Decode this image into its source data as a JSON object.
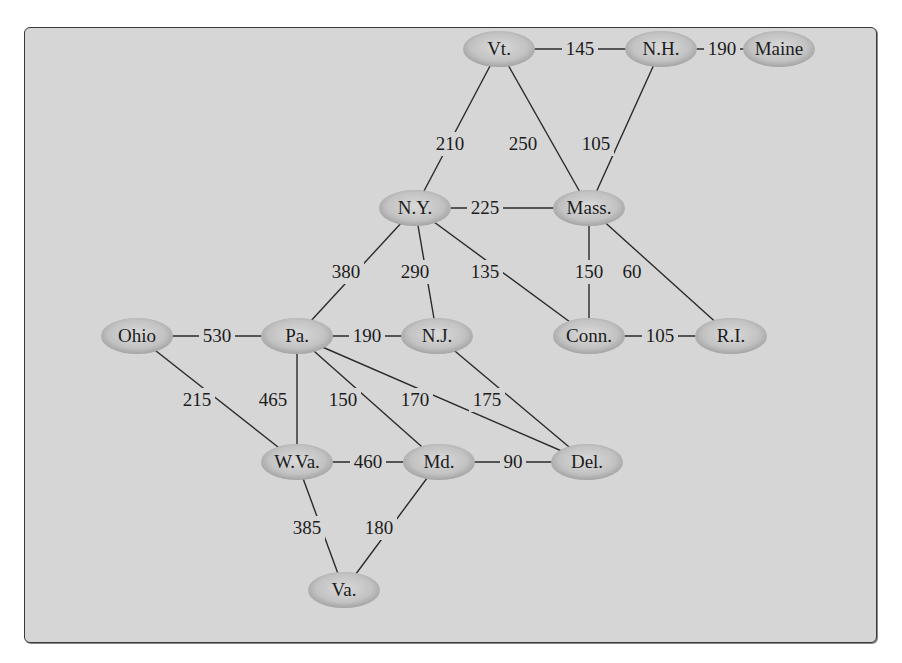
{
  "diagram": {
    "type": "weighted-undirected-graph",
    "colors": {
      "panel_bg": "#d6d6d6",
      "node_fill_center": "#d9d9d9",
      "node_fill_edge": "#9a9a9a",
      "edge": "#2a2a2a",
      "text": "#1c1c1c"
    },
    "nodes": [
      {
        "id": "vt",
        "label": "Vt.",
        "x": 474,
        "y": 21,
        "rx": 36,
        "ry": 18
      },
      {
        "id": "nh",
        "label": "N.H.",
        "x": 636,
        "y": 21,
        "rx": 36,
        "ry": 18
      },
      {
        "id": "me",
        "label": "Maine",
        "x": 754,
        "y": 21,
        "rx": 36,
        "ry": 18
      },
      {
        "id": "ny",
        "label": "N.Y.",
        "x": 390,
        "y": 180,
        "rx": 36,
        "ry": 18
      },
      {
        "id": "ma",
        "label": "Mass.",
        "x": 564,
        "y": 180,
        "rx": 36,
        "ry": 18
      },
      {
        "id": "oh",
        "label": "Ohio",
        "x": 112,
        "y": 308,
        "rx": 36,
        "ry": 18
      },
      {
        "id": "pa",
        "label": "Pa.",
        "x": 272,
        "y": 308,
        "rx": 36,
        "ry": 18
      },
      {
        "id": "nj",
        "label": "N.J.",
        "x": 412,
        "y": 308,
        "rx": 36,
        "ry": 18
      },
      {
        "id": "ct",
        "label": "Conn.",
        "x": 564,
        "y": 308,
        "rx": 36,
        "ry": 18
      },
      {
        "id": "ri",
        "label": "R.I.",
        "x": 706,
        "y": 308,
        "rx": 36,
        "ry": 18
      },
      {
        "id": "wv",
        "label": "W.Va.",
        "x": 272,
        "y": 434,
        "rx": 36,
        "ry": 18
      },
      {
        "id": "md",
        "label": "Md.",
        "x": 414,
        "y": 434,
        "rx": 36,
        "ry": 18
      },
      {
        "id": "de",
        "label": "Del.",
        "x": 562,
        "y": 434,
        "rx": 36,
        "ry": 18
      },
      {
        "id": "va",
        "label": "Va.",
        "x": 319,
        "y": 562,
        "rx": 36,
        "ry": 18
      }
    ],
    "edges": [
      {
        "from": "vt",
        "to": "nh",
        "weight": "145",
        "lx": 555,
        "ly": 21
      },
      {
        "from": "nh",
        "to": "me",
        "weight": "190",
        "lx": 697,
        "ly": 21
      },
      {
        "from": "vt",
        "to": "ny",
        "weight": "210",
        "lx": 425,
        "ly": 116
      },
      {
        "from": "vt",
        "to": "ma",
        "weight": "250",
        "lx": 498,
        "ly": 116
      },
      {
        "from": "nh",
        "to": "ma",
        "weight": "105",
        "lx": 571,
        "ly": 116
      },
      {
        "from": "ny",
        "to": "ma",
        "weight": "225",
        "lx": 460,
        "ly": 180
      },
      {
        "from": "ny",
        "to": "pa",
        "weight": "380",
        "lx": 321,
        "ly": 244
      },
      {
        "from": "ny",
        "to": "nj",
        "weight": "290",
        "lx": 390,
        "ly": 244
      },
      {
        "from": "ny",
        "to": "ct",
        "weight": "135",
        "lx": 460,
        "ly": 244
      },
      {
        "from": "ma",
        "to": "ct",
        "weight": "150",
        "lx": 564,
        "ly": 244
      },
      {
        "from": "ma",
        "to": "ri",
        "weight": "60",
        "lx": 607,
        "ly": 244
      },
      {
        "from": "oh",
        "to": "pa",
        "weight": "530",
        "lx": 192,
        "ly": 308
      },
      {
        "from": "pa",
        "to": "nj",
        "weight": "190",
        "lx": 342,
        "ly": 308
      },
      {
        "from": "ct",
        "to": "ri",
        "weight": "105",
        "lx": 635,
        "ly": 308
      },
      {
        "from": "oh",
        "to": "wv",
        "weight": "215",
        "lx": 172,
        "ly": 372
      },
      {
        "from": "pa",
        "to": "wv",
        "weight": "465",
        "lx": 248,
        "ly": 372
      },
      {
        "from": "pa",
        "to": "md",
        "weight": "150",
        "lx": 318,
        "ly": 372
      },
      {
        "from": "pa",
        "to": "de",
        "weight": "170",
        "lx": 390,
        "ly": 372
      },
      {
        "from": "nj",
        "to": "de",
        "weight": "175",
        "lx": 462,
        "ly": 372
      },
      {
        "from": "wv",
        "to": "md",
        "weight": "460",
        "lx": 343,
        "ly": 434
      },
      {
        "from": "md",
        "to": "de",
        "weight": "90",
        "lx": 488,
        "ly": 434
      },
      {
        "from": "wv",
        "to": "va",
        "weight": "385",
        "lx": 282,
        "ly": 500
      },
      {
        "from": "md",
        "to": "va",
        "weight": "180",
        "lx": 354,
        "ly": 500
      }
    ]
  }
}
